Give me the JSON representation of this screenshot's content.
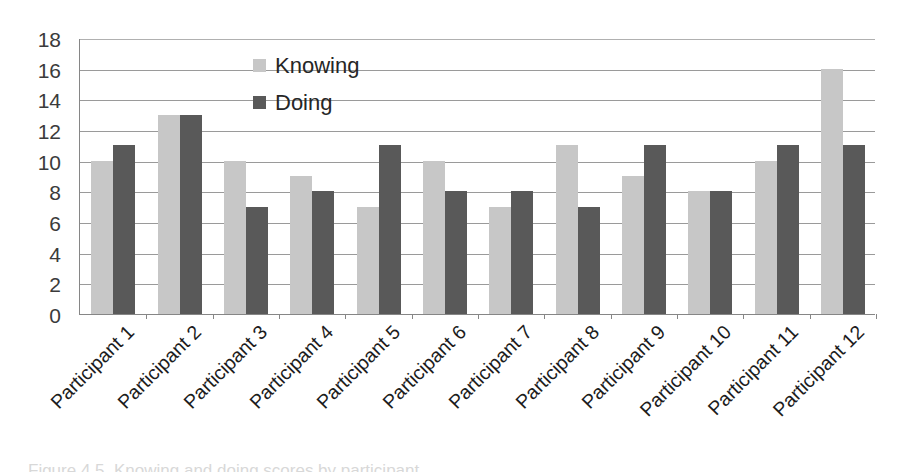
{
  "chart_data": {
    "type": "bar",
    "title": "",
    "subtitle": "",
    "xlabel": "",
    "ylabel": "",
    "ylim": [
      0,
      18
    ],
    "ytick_step": 2,
    "yticks": [
      18,
      16,
      14,
      12,
      10,
      8,
      6,
      4,
      2,
      0
    ],
    "grid": true,
    "grid_axis": "y",
    "legend_position": "inside-upper-left",
    "categories": [
      "Participant 1",
      "Participant 2",
      "Participant 3",
      "Participant 4",
      "Participant 5",
      "Participant 6",
      "Participant 7",
      "Participant 8",
      "Participant 9",
      "Participant 10",
      "Participant 11",
      "Participant 12"
    ],
    "series": [
      {
        "name": "Knowing",
        "color": "#c7c7c7",
        "values": [
          10,
          13,
          10,
          9,
          7,
          10,
          7,
          11,
          9,
          8,
          10,
          16
        ]
      },
      {
        "name": "Doing",
        "color": "#595959",
        "values": [
          11,
          13,
          7,
          8,
          11,
          8,
          8,
          7,
          11,
          8,
          11,
          11
        ]
      }
    ]
  },
  "colors": {
    "knowing": "#c7c7c7",
    "doing": "#595959",
    "gridline": "#9a9a9a",
    "axis": "#868686",
    "text": "#262626",
    "background": "#ffffff"
  },
  "caption": {
    "cut_off_text": "Figure 4.5. Knowing and doing scores by participant"
  }
}
